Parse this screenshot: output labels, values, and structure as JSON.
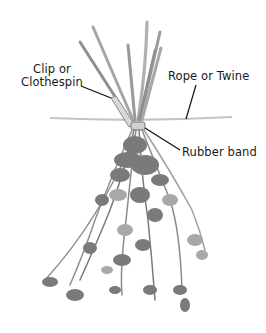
{
  "diagram": {
    "labels": {
      "clip_line1": "Clip or",
      "clip_line2": "Clothespin",
      "rope": "Rope or Twine",
      "band": "Rubber band"
    },
    "colors": {
      "background": "#ffffff",
      "stems": "#9a9a9a",
      "leaves": "#7a7a7a",
      "leaves_light": "#a8a8a8",
      "rope": "#bdbdbd",
      "leader_lines": "#111111",
      "text": "#1a1a1a"
    }
  }
}
